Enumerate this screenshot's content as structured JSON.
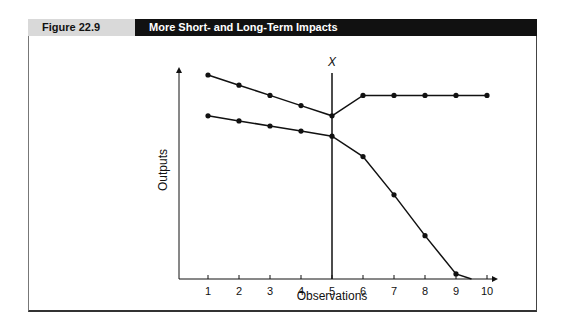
{
  "figure": {
    "number_label": "Figure 22.9",
    "title": "More Short- and Long-Term Impacts"
  },
  "chart_data": {
    "type": "line",
    "title": "More Short- and Long-Term Impacts",
    "xlabel": "Observations",
    "ylabel": "Outputs",
    "x": [
      1,
      2,
      3,
      4,
      5,
      6,
      7,
      8,
      9,
      10
    ],
    "xticks": [
      "1",
      "2",
      "3",
      "4",
      "5",
      "6",
      "7",
      "8",
      "9",
      "10"
    ],
    "yticks": [],
    "grid": false,
    "legend": null,
    "annotations": [
      {
        "text": "X",
        "type": "vertical-line",
        "x": 5,
        "note": "intervention point"
      }
    ],
    "series": [
      {
        "name": "upper",
        "x": [
          1,
          2,
          3,
          4,
          5,
          6,
          7,
          8,
          9,
          10
        ],
        "values": [
          8.0,
          7.6,
          7.2,
          6.8,
          6.4,
          7.2,
          7.2,
          7.2,
          7.2,
          7.2
        ]
      },
      {
        "name": "lower",
        "x": [
          1,
          2,
          3,
          4,
          5,
          6,
          7,
          8,
          9
        ],
        "values": [
          6.4,
          6.2,
          6.0,
          5.8,
          5.6,
          4.8,
          3.3,
          1.7,
          0.2
        ],
        "extends_to": {
          "x": 9.5,
          "y": 0
        }
      }
    ],
    "ylim": [
      0,
      10
    ],
    "xlim": [
      0,
      10.5
    ]
  }
}
